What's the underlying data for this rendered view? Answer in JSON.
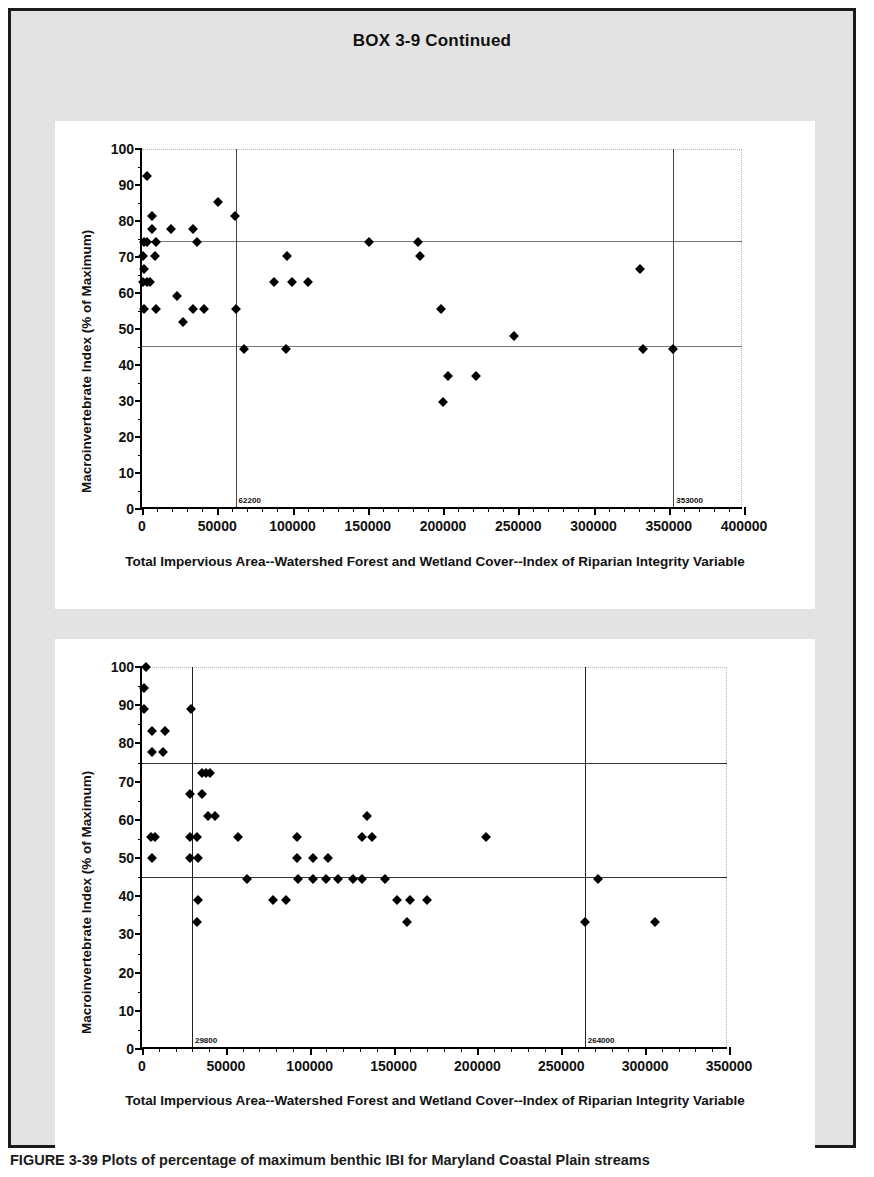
{
  "box": {
    "title": "BOX 3-9 Continued"
  },
  "caption": {
    "text": "FIGURE 3-39  Plots of percentage of maximum benthic IBI for Maryland Coastal Plain streams"
  },
  "chart_data": [
    {
      "id": "chart-top",
      "type": "scatter",
      "title": "",
      "xlabel": "Total Impervious Area--Watershed Forest and Wetland Cover--Index of Riparian Integrity Variable",
      "ylabel": "Macroinvertebrate Index (% of Maximum)",
      "xlim": [
        0,
        400000
      ],
      "ylim": [
        0,
        100
      ],
      "xticks": [
        0,
        50000,
        100000,
        150000,
        200000,
        250000,
        300000,
        350000,
        400000
      ],
      "xtick_labels": [
        "0",
        "50000",
        "100000",
        "150000",
        "200000",
        "250000",
        "300000",
        "350000",
        "400000"
      ],
      "xminor_step": 10000,
      "yticks": [
        0,
        10,
        20,
        30,
        40,
        50,
        60,
        70,
        80,
        90,
        100
      ],
      "ytick_labels": [
        "0",
        "10",
        "20",
        "30",
        "40",
        "50",
        "60",
        "70",
        "80",
        "90",
        "100"
      ],
      "yminor_step": 5,
      "grid": false,
      "legend": "none",
      "hlines": [
        {
          "y": 74.5,
          "label": ""
        },
        {
          "y": 45.3,
          "label": ""
        }
      ],
      "vlines": [
        {
          "x": 62200,
          "label": "62200"
        },
        {
          "x": 353000,
          "label": "353000"
        }
      ],
      "points": [
        {
          "x": 3000,
          "y": 92.6
        },
        {
          "x": 6500,
          "y": 81.5
        },
        {
          "x": 6500,
          "y": 77.8
        },
        {
          "x": 1500,
          "y": 74.1
        },
        {
          "x": 3500,
          "y": 74.1
        },
        {
          "x": 9500,
          "y": 74.1
        },
        {
          "x": 500,
          "y": 70.4
        },
        {
          "x": 8500,
          "y": 70.4
        },
        {
          "x": 1000,
          "y": 66.7
        },
        {
          "x": 500,
          "y": 63.0
        },
        {
          "x": 3500,
          "y": 63.0
        },
        {
          "x": 5500,
          "y": 63.0
        },
        {
          "x": 1500,
          "y": 55.6
        },
        {
          "x": 9000,
          "y": 55.6
        },
        {
          "x": 19000,
          "y": 77.8
        },
        {
          "x": 23000,
          "y": 59.3
        },
        {
          "x": 27000,
          "y": 51.9
        },
        {
          "x": 34000,
          "y": 77.8
        },
        {
          "x": 36500,
          "y": 74.1
        },
        {
          "x": 34000,
          "y": 55.6
        },
        {
          "x": 41000,
          "y": 55.6
        },
        {
          "x": 50500,
          "y": 85.2
        },
        {
          "x": 62000,
          "y": 81.5
        },
        {
          "x": 62500,
          "y": 55.6
        },
        {
          "x": 68000,
          "y": 44.4
        },
        {
          "x": 87500,
          "y": 63.0
        },
        {
          "x": 96500,
          "y": 70.4
        },
        {
          "x": 99500,
          "y": 63.0
        },
        {
          "x": 96000,
          "y": 44.4
        },
        {
          "x": 110000,
          "y": 63.0
        },
        {
          "x": 151000,
          "y": 74.1
        },
        {
          "x": 183500,
          "y": 74.1
        },
        {
          "x": 185000,
          "y": 70.4
        },
        {
          "x": 199000,
          "y": 55.6
        },
        {
          "x": 203000,
          "y": 37.0
        },
        {
          "x": 200000,
          "y": 29.6
        },
        {
          "x": 222000,
          "y": 37.0
        },
        {
          "x": 247000,
          "y": 48.1
        },
        {
          "x": 331000,
          "y": 66.7
        },
        {
          "x": 333000,
          "y": 44.4
        },
        {
          "x": 353000,
          "y": 44.4
        }
      ]
    },
    {
      "id": "chart-bot",
      "type": "scatter",
      "title": "",
      "xlabel": "Total Impervious Area--Watershed Forest and Wetland Cover--Index of Riparian Integrity Variable",
      "ylabel": "Macroinvertebrate Index (% of Maximum)",
      "xlim": [
        0,
        350000
      ],
      "ylim": [
        0,
        100
      ],
      "xticks": [
        0,
        50000,
        100000,
        150000,
        200000,
        250000,
        300000,
        350000
      ],
      "xtick_labels": [
        "0",
        "50000",
        "100000",
        "150000",
        "200000",
        "250000",
        "300000",
        "350000"
      ],
      "xminor_step": 10000,
      "yticks": [
        0,
        10,
        20,
        30,
        40,
        50,
        60,
        70,
        80,
        90,
        100
      ],
      "ytick_labels": [
        "0",
        "10",
        "20",
        "30",
        "40",
        "50",
        "60",
        "70",
        "80",
        "90",
        "100"
      ],
      "yminor_step": 5,
      "grid": false,
      "legend": "none",
      "hlines": [
        {
          "y": 74.8,
          "label": ""
        },
        {
          "y": 45.0,
          "label": ""
        }
      ],
      "vlines": [
        {
          "x": 29800,
          "label": "29800"
        },
        {
          "x": 264000,
          "label": "264000"
        }
      ],
      "points": [
        {
          "x": 2500,
          "y": 100.0
        },
        {
          "x": 1000,
          "y": 94.4
        },
        {
          "x": 1000,
          "y": 88.9
        },
        {
          "x": 6000,
          "y": 83.3
        },
        {
          "x": 14000,
          "y": 83.3
        },
        {
          "x": 6000,
          "y": 77.8
        },
        {
          "x": 12500,
          "y": 77.8
        },
        {
          "x": 5500,
          "y": 55.6
        },
        {
          "x": 8000,
          "y": 55.6
        },
        {
          "x": 6000,
          "y": 50.0
        },
        {
          "x": 29000,
          "y": 88.9
        },
        {
          "x": 35500,
          "y": 72.2
        },
        {
          "x": 38000,
          "y": 72.2
        },
        {
          "x": 40500,
          "y": 72.2
        },
        {
          "x": 28500,
          "y": 66.7
        },
        {
          "x": 35500,
          "y": 66.7
        },
        {
          "x": 39500,
          "y": 61.1
        },
        {
          "x": 43500,
          "y": 61.1
        },
        {
          "x": 28500,
          "y": 55.6
        },
        {
          "x": 33000,
          "y": 55.6
        },
        {
          "x": 28500,
          "y": 50.0
        },
        {
          "x": 33500,
          "y": 50.0
        },
        {
          "x": 33500,
          "y": 38.9
        },
        {
          "x": 33000,
          "y": 33.3
        },
        {
          "x": 57000,
          "y": 55.6
        },
        {
          "x": 62500,
          "y": 44.4
        },
        {
          "x": 78000,
          "y": 38.9
        },
        {
          "x": 86000,
          "y": 38.9
        },
        {
          "x": 92500,
          "y": 55.6
        },
        {
          "x": 92500,
          "y": 50.0
        },
        {
          "x": 93000,
          "y": 44.4
        },
        {
          "x": 102000,
          "y": 50.0
        },
        {
          "x": 102000,
          "y": 44.4
        },
        {
          "x": 111000,
          "y": 50.0
        },
        {
          "x": 110000,
          "y": 44.4
        },
        {
          "x": 117000,
          "y": 44.4
        },
        {
          "x": 126000,
          "y": 44.4
        },
        {
          "x": 131000,
          "y": 44.4
        },
        {
          "x": 134000,
          "y": 61.1
        },
        {
          "x": 131000,
          "y": 55.6
        },
        {
          "x": 137000,
          "y": 55.6
        },
        {
          "x": 145000,
          "y": 44.4
        },
        {
          "x": 152000,
          "y": 38.9
        },
        {
          "x": 158000,
          "y": 33.3
        },
        {
          "x": 160000,
          "y": 38.9
        },
        {
          "x": 170000,
          "y": 38.9
        },
        {
          "x": 205000,
          "y": 55.6
        },
        {
          "x": 264000,
          "y": 33.3
        },
        {
          "x": 272000,
          "y": 44.4
        },
        {
          "x": 306000,
          "y": 33.3
        }
      ]
    }
  ]
}
